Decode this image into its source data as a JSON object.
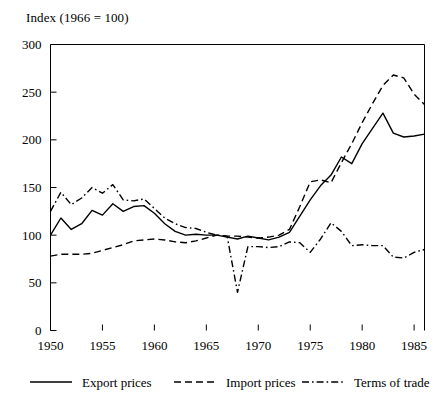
{
  "chart_data": {
    "type": "line",
    "title": "Index (1966 = 100)",
    "xlabel": "",
    "ylabel": "Index (1966 = 100)",
    "xlim": [
      1950,
      1986
    ],
    "ylim": [
      0,
      300
    ],
    "ytick_values": [
      0,
      50,
      100,
      150,
      200,
      250,
      300
    ],
    "ytick_labels": [
      "0",
      "50",
      "100",
      "150",
      "200",
      "250",
      "300"
    ],
    "xtick_values": [
      1950,
      1955,
      1960,
      1965,
      1970,
      1975,
      1980,
      1985
    ],
    "xtick_labels": [
      "1950",
      "1955",
      "1960",
      "1965",
      "1970",
      "1975",
      "1980",
      "1985"
    ],
    "grid": false,
    "legend_position": "bottom",
    "x": [
      1950,
      1951,
      1952,
      1953,
      1954,
      1955,
      1956,
      1957,
      1958,
      1959,
      1960,
      1961,
      1962,
      1963,
      1964,
      1965,
      1966,
      1967,
      1968,
      1969,
      1970,
      1971,
      1972,
      1973,
      1974,
      1975,
      1976,
      1977,
      1978,
      1979,
      1980,
      1981,
      1982,
      1983,
      1984,
      1985,
      1986
    ],
    "series": [
      {
        "name": "Export prices",
        "style": "solid",
        "color": "#000000",
        "values": [
          100,
          118,
          106,
          112,
          126,
          121,
          133,
          125,
          130,
          131,
          123,
          112,
          104,
          100,
          101,
          100,
          100,
          98,
          96,
          99,
          97,
          95,
          98,
          103,
          120,
          137,
          152,
          163,
          182,
          175,
          196,
          212,
          228,
          207,
          203,
          204,
          206
        ]
      },
      {
        "name": "Import prices",
        "style": "dashed",
        "color": "#000000",
        "values": [
          78,
          80,
          80,
          80,
          81,
          84,
          87,
          90,
          94,
          95,
          96,
          95,
          93,
          92,
          94,
          97,
          100,
          99,
          99,
          98,
          97,
          98,
          100,
          106,
          130,
          156,
          158,
          155,
          176,
          196,
          218,
          238,
          257,
          268,
          265,
          248,
          237
        ]
      },
      {
        "name": "Terms of trade",
        "style": "dashdot",
        "color": "#000000",
        "values": [
          125,
          145,
          132,
          139,
          150,
          144,
          153,
          137,
          136,
          138,
          128,
          118,
          112,
          108,
          107,
          103,
          100,
          99,
          40,
          88,
          88,
          87,
          88,
          93,
          92,
          82,
          96,
          113,
          104,
          89,
          90,
          89,
          89,
          77,
          76,
          82,
          85
        ]
      }
    ],
    "legend": [
      {
        "label": "Export prices",
        "style": "solid"
      },
      {
        "label": "Import prices",
        "style": "dashed"
      },
      {
        "label": "Terms of trade",
        "style": "dashdot"
      }
    ]
  }
}
